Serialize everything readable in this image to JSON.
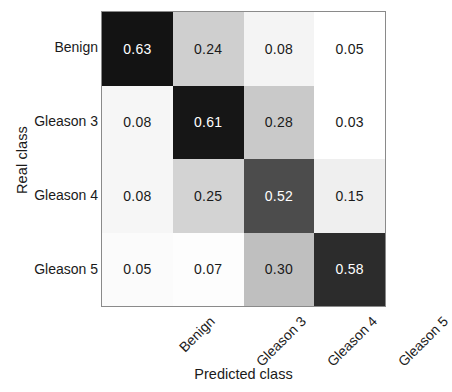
{
  "chart_data": {
    "type": "heatmap",
    "title": "",
    "xlabel": "Predicted class",
    "ylabel": "Real class",
    "categories": [
      "Benign",
      "Gleason 3",
      "Gleason 4",
      "Gleason 5"
    ],
    "x_tick_labels": [
      "Benign",
      "Gleason 3",
      "Gleason 4",
      "Gleason 5"
    ],
    "y_tick_labels": [
      "Benign",
      "Gleason 3",
      "Gleason 4",
      "Gleason 5"
    ],
    "grid": false,
    "legend": "none",
    "colormap": "grayscale-reversed",
    "vmin": 0.0,
    "vmax": 0.63,
    "rows": [
      {
        "label": "Benign",
        "cells": [
          {
            "value": "0.63",
            "fill": "#131313",
            "text": "#ffffff"
          },
          {
            "value": "0.24",
            "fill": "#cfcfcf",
            "text": "#1a1a1a"
          },
          {
            "value": "0.08",
            "fill": "#f4f4f4",
            "text": "#1a1a1a"
          },
          {
            "value": "0.05",
            "fill": "#ffffff",
            "text": "#1a1a1a"
          }
        ]
      },
      {
        "label": "Gleason 3",
        "cells": [
          {
            "value": "0.08",
            "fill": "#f6f6f6",
            "text": "#1a1a1a"
          },
          {
            "value": "0.61",
            "fill": "#161616",
            "text": "#ffffff"
          },
          {
            "value": "0.28",
            "fill": "#c9c9c9",
            "text": "#1a1a1a"
          },
          {
            "value": "0.03",
            "fill": "#ffffff",
            "text": "#1a1a1a"
          }
        ]
      },
      {
        "label": "Gleason 4",
        "cells": [
          {
            "value": "0.08",
            "fill": "#f6f6f6",
            "text": "#1a1a1a"
          },
          {
            "value": "0.25",
            "fill": "#d3d3d3",
            "text": "#1a1a1a"
          },
          {
            "value": "0.52",
            "fill": "#4c4c4c",
            "text": "#ffffff"
          },
          {
            "value": "0.15",
            "fill": "#efefef",
            "text": "#1a1a1a"
          }
        ]
      },
      {
        "label": "Gleason 5",
        "cells": [
          {
            "value": "0.05",
            "fill": "#fbfbfb",
            "text": "#1a1a1a"
          },
          {
            "value": "0.07",
            "fill": "#fdfdfd",
            "text": "#1a1a1a"
          },
          {
            "value": "0.30",
            "fill": "#bfbfbf",
            "text": "#1a1a1a"
          },
          {
            "value": "0.58",
            "fill": "#2c2c2c",
            "text": "#ffffff"
          }
        ]
      }
    ],
    "values": [
      [
        0.63,
        0.24,
        0.08,
        0.05
      ],
      [
        0.08,
        0.61,
        0.28,
        0.03
      ],
      [
        0.08,
        0.25,
        0.52,
        0.15
      ],
      [
        0.05,
        0.07,
        0.3,
        0.58
      ]
    ]
  },
  "axes": {
    "border_color": "#8a8a8a"
  }
}
